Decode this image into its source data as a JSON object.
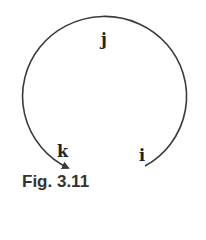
{
  "figure": {
    "caption": "Fig. 3.11",
    "labels": {
      "j": "j",
      "k": "k",
      "i": "i"
    },
    "colors": {
      "stroke": "#3a3a3a",
      "text": "#222222"
    }
  }
}
